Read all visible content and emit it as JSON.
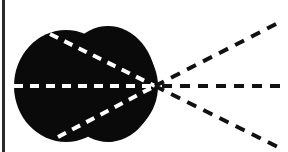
{
  "diagram": {
    "colors": {
      "background": "#ffffff",
      "blob": "#0a0a0a",
      "inner_rays": "#ffffff",
      "outer_rays": "#111111",
      "left_rule": "#2a2a2a"
    },
    "focal_point": {
      "x": 155,
      "y": 86
    },
    "inner_rays": [
      {
        "name": "upper-inner-ray",
        "from": [
          50,
          34
        ]
      },
      {
        "name": "middle-inner-ray",
        "from": [
          14,
          86
        ]
      },
      {
        "name": "lower-inner-ray",
        "from": [
          58,
          137
        ]
      }
    ],
    "outer_rays": [
      {
        "name": "upper-outer-ray",
        "to": [
          280,
          22
        ]
      },
      {
        "name": "middle-outer-ray",
        "to": [
          288,
          86
        ]
      },
      {
        "name": "lower-outer-ray",
        "to": [
          280,
          148
        ]
      }
    ]
  }
}
